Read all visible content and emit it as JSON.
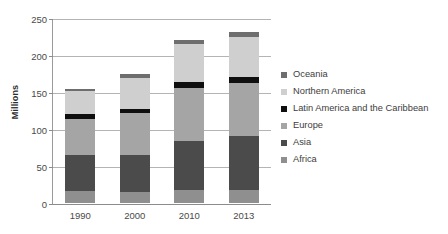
{
  "chart_data": {
    "type": "bar",
    "stacked": true,
    "title": "",
    "xlabel": "",
    "ylabel": "Millions",
    "ylim": [
      0,
      250
    ],
    "yticks": [
      0,
      50,
      100,
      150,
      200,
      250
    ],
    "grid": true,
    "legend_position": "right",
    "categories": [
      "1990",
      "2000",
      "2010",
      "2013"
    ],
    "series": [
      {
        "name": "Africa",
        "color": "#8f8f8f",
        "values": [
          16,
          15,
          17,
          18
        ]
      },
      {
        "name": "Asia",
        "color": "#4b4b4b",
        "values": [
          49,
          50,
          67,
          72
        ]
      },
      {
        "name": "Europe",
        "color": "#a5a5a5",
        "values": [
          49,
          56,
          72,
          72
        ]
      },
      {
        "name": "Latin America and the Caribbean",
        "color": "#0f0f0f",
        "values": [
          7,
          6,
          8,
          9
        ]
      },
      {
        "name": "Northern America",
        "color": "#cfcfcf",
        "values": [
          30,
          42,
          51,
          53
        ]
      },
      {
        "name": "Oceania",
        "color": "#6e6e6e",
        "values": [
          3,
          5,
          6,
          7
        ]
      }
    ],
    "totals": [
      154,
      174,
      221,
      231
    ]
  },
  "axis": {
    "y_title": "Millions",
    "y_tick_labels": [
      "0",
      "50",
      "100",
      "150",
      "200",
      "250"
    ],
    "x_tick_labels": [
      "1990",
      "2000",
      "2010",
      "2013"
    ]
  },
  "legend": {
    "items": [
      {
        "label": "Oceania",
        "color": "#6e6e6e"
      },
      {
        "label": "Northern America",
        "color": "#cfcfcf"
      },
      {
        "label": "Latin America and the Caribbean",
        "color": "#0f0f0f"
      },
      {
        "label": "Europe",
        "color": "#a5a5a5"
      },
      {
        "label": "Asia",
        "color": "#4b4b4b"
      },
      {
        "label": "Africa",
        "color": "#8f8f8f"
      }
    ]
  }
}
